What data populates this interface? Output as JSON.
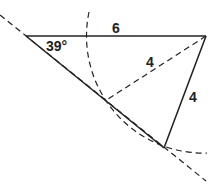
{
  "diagram": {
    "angle_label": "39°",
    "side_top_label": "6",
    "side_dashed_label": "4",
    "side_solid_label": "4",
    "vertices": {
      "A": [
        26,
        36
      ],
      "B": [
        206,
        36
      ],
      "C1": [
        105,
        101
      ],
      "C2": [
        164,
        148
      ]
    },
    "arc": {
      "center": [
        206,
        36
      ],
      "radius": 117
    },
    "colors": {
      "stroke": "#222222",
      "background": "#ffffff"
    }
  }
}
